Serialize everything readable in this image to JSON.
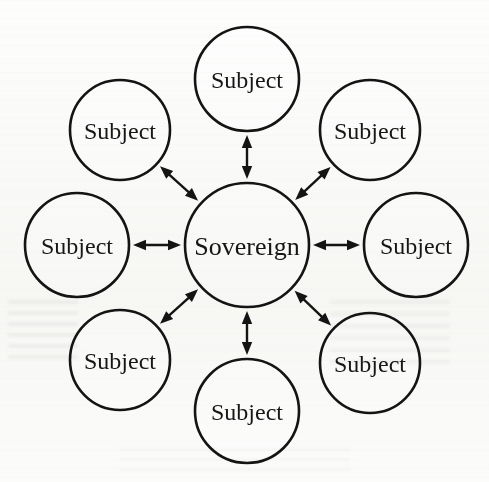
{
  "diagram": {
    "type": "hub-and-spoke-node-diagram",
    "title": "",
    "background_color": "#fdfdfc",
    "stroke_color": "#141414",
    "node_fill_color": "#fefefe",
    "text_color": "#161616",
    "edge_style": "double-headed-arrow",
    "center": {
      "id": "sovereign",
      "label": "Sovereign",
      "cx": 247,
      "cy": 245,
      "r": 62,
      "stroke_width": 2.6,
      "font_size": 26
    },
    "spokes": [
      {
        "id": "subject-n",
        "label": "Subject",
        "cx": 247,
        "cy": 79,
        "r": 52,
        "angle_deg": 90,
        "stroke_width": 2.6,
        "font_size": 24
      },
      {
        "id": "subject-ne",
        "label": "Subject",
        "cx": 370,
        "cy": 130,
        "r": 50,
        "angle_deg": 45,
        "stroke_width": 2.6,
        "font_size": 24
      },
      {
        "id": "subject-e",
        "label": "Subject",
        "cx": 416,
        "cy": 245,
        "r": 52,
        "angle_deg": 0,
        "stroke_width": 2.6,
        "font_size": 24
      },
      {
        "id": "subject-se",
        "label": "Subject",
        "cx": 370,
        "cy": 363,
        "r": 50,
        "angle_deg": -45,
        "stroke_width": 2.6,
        "font_size": 24
      },
      {
        "id": "subject-s",
        "label": "Subject",
        "cx": 247,
        "cy": 411,
        "r": 52,
        "angle_deg": -90,
        "stroke_width": 2.6,
        "font_size": 24
      },
      {
        "id": "subject-sw",
        "label": "Subject",
        "cx": 120,
        "cy": 360,
        "r": 50,
        "angle_deg": -135,
        "stroke_width": 2.6,
        "font_size": 24
      },
      {
        "id": "subject-w",
        "label": "Subject",
        "cx": 77,
        "cy": 245,
        "r": 52,
        "angle_deg": 180,
        "stroke_width": 2.6,
        "font_size": 24
      },
      {
        "id": "subject-nw",
        "label": "Subject",
        "cx": 120,
        "cy": 130,
        "r": 50,
        "angle_deg": 135,
        "stroke_width": 2.6,
        "font_size": 24
      }
    ],
    "edges": [
      {
        "id": "edge-n",
        "from": "sovereign",
        "to": "subject-n",
        "bidirectional": true
      },
      {
        "id": "edge-ne",
        "from": "sovereign",
        "to": "subject-ne",
        "bidirectional": true
      },
      {
        "id": "edge-e",
        "from": "sovereign",
        "to": "subject-e",
        "bidirectional": true
      },
      {
        "id": "edge-se",
        "from": "sovereign",
        "to": "subject-se",
        "bidirectional": true
      },
      {
        "id": "edge-s",
        "from": "sovereign",
        "to": "subject-s",
        "bidirectional": true
      },
      {
        "id": "edge-sw",
        "from": "sovereign",
        "to": "subject-sw",
        "bidirectional": true
      },
      {
        "id": "edge-w",
        "from": "sovereign",
        "to": "subject-w",
        "bidirectional": true
      },
      {
        "id": "edge-nw",
        "from": "sovereign",
        "to": "subject-nw",
        "bidirectional": true
      }
    ]
  }
}
